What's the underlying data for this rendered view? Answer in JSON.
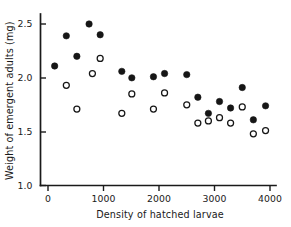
{
  "chart_data": {
    "type": "scatter",
    "title": "",
    "xlabel": "Density of hatched larvae",
    "ylabel": "Weight of emergent adults (mg)",
    "xlim": [
      0,
      4200
    ],
    "ylim": [
      1.0,
      2.62
    ],
    "grid": false,
    "legend_position": "none",
    "xticks": [
      0,
      1000,
      2000,
      3000,
      4000
    ],
    "xticklabels": [
      "0",
      "1000",
      "2000",
      "3000",
      "4000"
    ],
    "yticks": [
      1.0,
      1.5,
      2.0,
      2.5
    ],
    "yticklabels": [
      "1.0",
      "1.5",
      "2.0",
      "2.5"
    ],
    "series": [
      {
        "name": "filled-circles",
        "marker": "filled circle",
        "color": "#161616",
        "points": [
          [
            120,
            2.11
          ],
          [
            330,
            2.39
          ],
          [
            520,
            2.2
          ],
          [
            740,
            2.5
          ],
          [
            940,
            2.4
          ],
          [
            1330,
            2.06
          ],
          [
            1510,
            2.0
          ],
          [
            1900,
            2.01
          ],
          [
            2100,
            2.04
          ],
          [
            2500,
            2.03
          ],
          [
            2700,
            1.82
          ],
          [
            2890,
            1.67
          ],
          [
            3090,
            1.78
          ],
          [
            3290,
            1.72
          ],
          [
            3500,
            1.91
          ],
          [
            3700,
            1.61
          ],
          [
            3920,
            1.74
          ]
        ]
      },
      {
        "name": "open-circles",
        "marker": "open circle",
        "color": "#ffffff",
        "points": [
          [
            330,
            1.93
          ],
          [
            520,
            1.71
          ],
          [
            800,
            2.04
          ],
          [
            940,
            2.18
          ],
          [
            1330,
            1.67
          ],
          [
            1510,
            1.85
          ],
          [
            1900,
            1.71
          ],
          [
            2100,
            1.86
          ],
          [
            2500,
            1.75
          ],
          [
            2700,
            1.58
          ],
          [
            2890,
            1.6
          ],
          [
            3090,
            1.63
          ],
          [
            3290,
            1.58
          ],
          [
            3500,
            1.73
          ],
          [
            3700,
            1.48
          ],
          [
            3920,
            1.51
          ]
        ]
      }
    ]
  },
  "axes": {
    "x_axis_name": "x-axis",
    "y_axis_name": "y-axis"
  }
}
